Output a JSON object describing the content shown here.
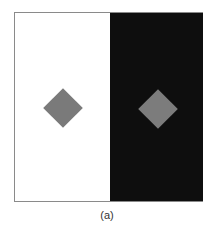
{
  "figure": {
    "caption": "(a)",
    "panels": [
      {
        "name": "left",
        "background": "#ffffff",
        "diamond_color": "#7a7a7a"
      },
      {
        "name": "right",
        "background": "#0e0e0e",
        "diamond_color": "#7c7c7c"
      }
    ]
  }
}
